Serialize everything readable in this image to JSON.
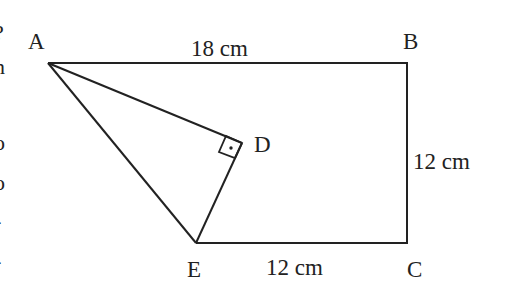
{
  "figure": {
    "type": "geometry-diagram",
    "vertices": {
      "A": {
        "label": "A",
        "x": 48,
        "y": 63
      },
      "B": {
        "label": "B",
        "x": 407,
        "y": 63
      },
      "C": {
        "label": "C",
        "x": 407,
        "y": 243
      },
      "E": {
        "label": "E",
        "x": 196,
        "y": 243
      },
      "D": {
        "label": "D",
        "x": 242,
        "y": 143
      }
    },
    "measurements": {
      "AB": "18 cm",
      "BC": "12 cm",
      "EC": "12 cm"
    },
    "right_angle_at": "D",
    "stroke_color": "#222222",
    "left_edge_fragments": [
      "?",
      "n",
      ".",
      "o",
      "o",
      "-",
      "-"
    ]
  }
}
